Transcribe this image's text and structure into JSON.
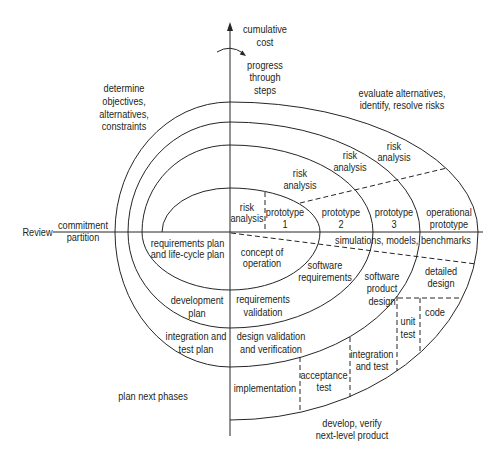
{
  "diagram": {
    "colors": {
      "line": "#262626",
      "text": "#231f20",
      "background": "#ffffff"
    }
  },
  "axes": {
    "vertical_label": [
      "cumulative",
      "cost"
    ],
    "rotation_label": [
      "progress",
      "through",
      "steps"
    ],
    "review_label": "Review",
    "review_line_label": [
      "commitment",
      "partition"
    ]
  },
  "quadrants": {
    "top_left": [
      "determine",
      "objectives,",
      "alternatives,",
      "constraints"
    ],
    "top_right": [
      "evaluate alternatives,",
      "identify, resolve risks"
    ],
    "bottom_left": "plan next phases",
    "bottom_right": [
      "develop, verify",
      "next-level product"
    ]
  },
  "risk_analysis": [
    [
      "risk",
      "analysis"
    ],
    [
      "risk",
      "analysis"
    ],
    [
      "risk",
      "analysis"
    ],
    [
      "risk",
      "analysis"
    ]
  ],
  "prototypes": [
    [
      "prototype",
      "1"
    ],
    [
      "prototype",
      "2"
    ],
    [
      "prototype",
      "3"
    ],
    [
      "operational",
      "prototype"
    ]
  ],
  "simulations": "simulations, models, benchmarks",
  "plans": {
    "requirements_plan": [
      "requirements plan",
      "and life-cycle plan"
    ],
    "development_plan": [
      "development",
      "plan"
    ],
    "integration_test_plan": [
      "integration and",
      "test plan"
    ]
  },
  "validation": {
    "concept": [
      "concept of",
      "operation"
    ],
    "requirements_validation": [
      "requirements",
      "validation"
    ],
    "design_vv": [
      "design validation",
      "and verification"
    ]
  },
  "development": {
    "software_requirements": [
      "software",
      "requirements"
    ],
    "software_product_design": [
      "software",
      "product",
      "design"
    ],
    "detailed_design": [
      "detailed",
      "design"
    ],
    "code": "code",
    "unit_test": [
      "unit",
      "test"
    ],
    "integration_test": [
      "integration",
      "and test"
    ],
    "acceptance_test": [
      "acceptance",
      "test"
    ],
    "implementation": "implementation"
  }
}
